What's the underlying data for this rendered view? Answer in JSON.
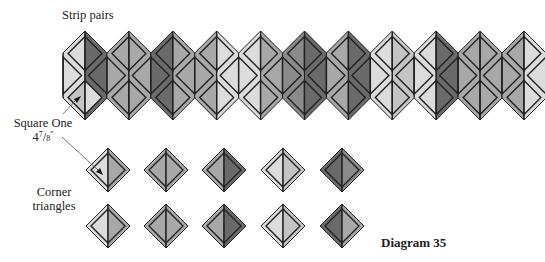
{
  "labels": {
    "strip_pairs": "Strip pairs",
    "square_one": "Square One",
    "square_one_size_whole": "4",
    "square_one_size_num": "7",
    "square_one_size_den": "8",
    "square_one_size_unit": "\"",
    "corner_triangles_line1": "Corner",
    "corner_triangles_line2": "triangles",
    "diagram_title": "Diagram 35"
  },
  "colors": {
    "outline": "#222222",
    "background": "#ffffff",
    "very_light": "#dcdcdc",
    "light": "#c4c4c4",
    "medium": "#a8a8a8",
    "medium_dark": "#8a8a8a",
    "dark": "#6a6a6a"
  },
  "strip": {
    "count": 11,
    "first_center_x": 85,
    "spacing": 43.9,
    "top_y": 31,
    "shoulder_y": 53,
    "hip_y": 98,
    "bottom_y": 120,
    "columns": [
      {
        "left": "very_light",
        "right": "dark",
        "inner_top_l": "very_light",
        "inner_top_r": "dark",
        "inner_bot_l": "light",
        "inner_bot_r": "very_light"
      },
      {
        "left": "medium",
        "right": "medium",
        "inner_top_l": "medium",
        "inner_top_r": "medium",
        "inner_bot_l": "medium",
        "inner_bot_r": "medium"
      },
      {
        "left": "dark",
        "right": "medium",
        "inner_top_l": "dark",
        "inner_top_r": "medium",
        "inner_bot_l": "dark",
        "inner_bot_r": "medium"
      },
      {
        "left": "medium",
        "right": "very_light",
        "inner_top_l": "medium",
        "inner_top_r": "very_light",
        "inner_bot_l": "medium",
        "inner_bot_r": "very_light"
      },
      {
        "left": "very_light",
        "right": "medium",
        "inner_top_l": "very_light",
        "inner_top_r": "medium",
        "inner_bot_l": "very_light",
        "inner_bot_r": "medium"
      },
      {
        "left": "medium_dark",
        "right": "dark",
        "inner_top_l": "medium_dark",
        "inner_top_r": "dark",
        "inner_bot_l": "medium_dark",
        "inner_bot_r": "dark"
      },
      {
        "left": "medium",
        "right": "dark",
        "inner_top_l": "medium",
        "inner_top_r": "dark",
        "inner_bot_l": "medium",
        "inner_bot_r": "dark"
      },
      {
        "left": "very_light",
        "right": "light",
        "inner_top_l": "very_light",
        "inner_top_r": "light",
        "inner_bot_l": "very_light",
        "inner_bot_r": "light"
      },
      {
        "left": "very_light",
        "right": "dark",
        "inner_top_l": "very_light",
        "inner_top_r": "dark",
        "inner_bot_l": "very_light",
        "inner_bot_r": "dark"
      },
      {
        "left": "medium",
        "right": "medium",
        "inner_top_l": "medium",
        "inner_top_r": "medium",
        "inner_bot_l": "medium",
        "inner_bot_r": "medium"
      },
      {
        "left": "medium",
        "right": "very_light",
        "inner_top_l": "medium",
        "inner_top_r": "very_light",
        "inner_bot_l": "medium",
        "inner_bot_r": "very_light"
      }
    ]
  },
  "squares": {
    "row_centers_y": [
      170,
      226
    ],
    "col_centers_x": [
      108,
      166,
      224,
      283,
      342
    ],
    "half_size": 22,
    "rows": [
      [
        {
          "left": "very_light",
          "right": "medium"
        },
        {
          "left": "medium",
          "right": "medium"
        },
        {
          "left": "medium",
          "right": "dark"
        },
        {
          "left": "very_light",
          "right": "light"
        },
        {
          "left": "dark",
          "right": "medium_dark"
        }
      ],
      [
        {
          "left": "very_light",
          "right": "medium"
        },
        {
          "left": "medium",
          "right": "medium"
        },
        {
          "left": "medium",
          "right": "dark"
        },
        {
          "left": "very_light",
          "right": "light"
        },
        {
          "left": "dark",
          "right": "medium"
        }
      ]
    ]
  }
}
